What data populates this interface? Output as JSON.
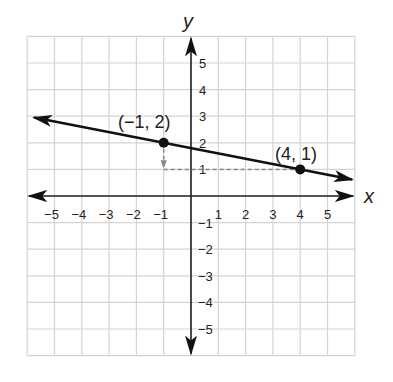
{
  "chart_data": {
    "type": "line",
    "title": "",
    "xlabel": "x",
    "ylabel": "y",
    "xlim": [
      -6,
      6
    ],
    "ylim": [
      -6,
      6
    ],
    "grid": true,
    "x_ticks": [
      -5,
      -4,
      -3,
      -2,
      -1,
      1,
      2,
      3,
      4,
      5
    ],
    "y_ticks": [
      5,
      4,
      3,
      2,
      1,
      -1,
      -2,
      -3,
      -4,
      -5
    ],
    "series": [
      {
        "name": "line",
        "x": [
          -6,
          6
        ],
        "y": [
          2.2,
          -0.2
        ],
        "style": "solid-arrows-both-ends",
        "slope": -0.2,
        "intercept": 1.8
      }
    ],
    "points": [
      {
        "x": -1,
        "y": 2,
        "label": "(−1, 2)"
      },
      {
        "x": 4,
        "y": 1,
        "label": "(4, 1)"
      }
    ],
    "annotations": [
      {
        "type": "dashed-arrow",
        "from": [
          -1,
          2
        ],
        "to": [
          -1,
          1
        ],
        "description": "rise"
      },
      {
        "type": "dashed-line",
        "from": [
          -1,
          1
        ],
        "to": [
          4,
          1
        ],
        "description": "run"
      }
    ]
  },
  "labels": {
    "x_axis": "x",
    "y_axis": "y",
    "point_a": "(−1, 2)",
    "point_b": "(4, 1)"
  }
}
